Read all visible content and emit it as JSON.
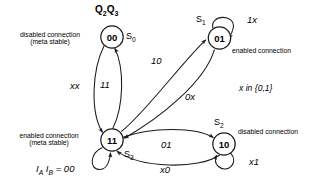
{
  "diagram": {
    "title": "Q2Q3",
    "title_html": "Q<sub>2</sub>Q<sub>3</sub>",
    "condition_note": "x in {0,1}",
    "input_formula_html": "I<sub>A</sub> I<sub>B</sub> = 00",
    "stroke_color": "#1a1a1a",
    "background_color": "#ffffff"
  },
  "states": [
    {
      "id": "S0",
      "value": "00",
      "name_html": "S<sub>0</sub>",
      "annotation": "disabled connection\n(meta stable)",
      "annotation_line1": "disabled connection",
      "annotation_line2": "(meta stable)"
    },
    {
      "id": "S1",
      "value": "01",
      "name_html": "S<sub>1</sub>",
      "annotation": "enabled connection",
      "annotation_line1": "enabled connection",
      "annotation_line2": ""
    },
    {
      "id": "S2",
      "value": "10",
      "name_html": "S<sub>2</sub>",
      "annotation": "disabled connection",
      "annotation_line1": "disabled connection",
      "annotation_line2": ""
    },
    {
      "id": "S3",
      "value": "11",
      "name_html": "S<sub>3</sub>",
      "annotation": "enabled connection\n(meta stable)",
      "annotation_line1": "enabled connection",
      "annotation_line2": "(meta stable)"
    }
  ],
  "transitions": [
    {
      "from": "00",
      "to": "11",
      "label": "xx"
    },
    {
      "from": "11",
      "to": "00",
      "label": "11"
    },
    {
      "from": "11",
      "to": "01",
      "label": "10"
    },
    {
      "from": "01",
      "to": "11",
      "label": "0x"
    },
    {
      "from": "11",
      "to": "10",
      "label": "01"
    },
    {
      "from": "10",
      "to": "11",
      "label": "x0"
    },
    {
      "from": "01",
      "to": "01",
      "label": "1x"
    },
    {
      "from": "10",
      "to": "10",
      "label": "x1"
    },
    {
      "from": "11",
      "to": "11",
      "label": ""
    }
  ]
}
